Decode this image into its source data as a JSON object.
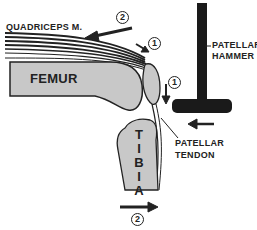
{
  "diagram": {
    "labels": {
      "quadriceps": "QUADRICEPS M.",
      "femur": "FEMUR",
      "tibia_letters": [
        "T",
        "I",
        "B",
        "I",
        "A"
      ],
      "patellar_hammer_line1": "PATELLAR",
      "patellar_hammer_line2": "HAMMER",
      "patellar_tendon_line1": "PATELLAR",
      "patellar_tendon_line2": "TENDON"
    },
    "markers": {
      "step1": "1",
      "step2": "2"
    },
    "colors": {
      "bone": "#c8c8c8",
      "ink": "#222222",
      "hammer": "#1a1a1a"
    }
  }
}
